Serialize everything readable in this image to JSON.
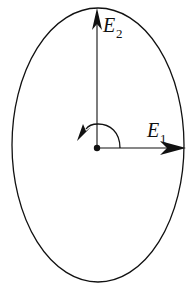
{
  "diagram": {
    "type": "polarization-ellipse",
    "colors": {
      "stroke": "#111111",
      "background": "#ffffff"
    },
    "ellipse": {
      "cx": 98,
      "cy": 145,
      "rx": 86,
      "ry": 137
    },
    "origin": {
      "x": 97,
      "y": 148
    },
    "axes": [
      {
        "id": "E1",
        "label": "E",
        "subscript": "1",
        "direction": "horizontal-right"
      },
      {
        "id": "E2",
        "label": "E",
        "subscript": "2",
        "direction": "vertical-up"
      }
    ],
    "rotation_arrow": {
      "direction": "counterclockwise"
    }
  }
}
